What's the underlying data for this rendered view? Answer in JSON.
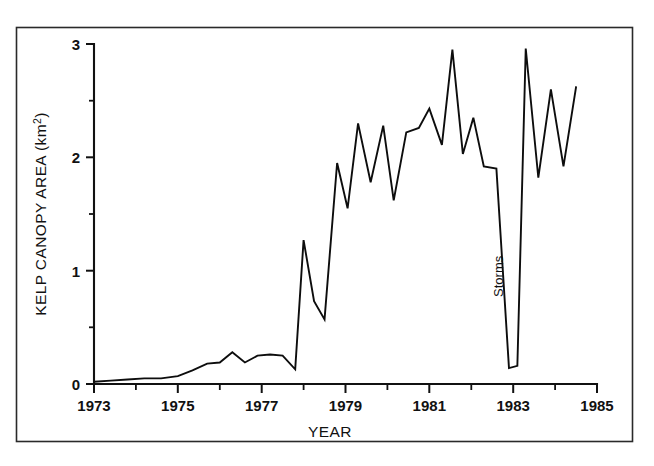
{
  "chart_data": {
    "type": "line",
    "title": "",
    "xlabel": "YEAR",
    "ylabel": "KELP CANOPY AREA (km",
    "ylabel_superscript": "2",
    "ylabel_suffix": ")",
    "ylabel_full": "KELP CANOPY AREA (km2)",
    "xlim": [
      1973,
      1985
    ],
    "ylim": [
      0,
      3
    ],
    "grid": false,
    "legend": null,
    "x_major_ticks": [
      1973,
      1975,
      1977,
      1979,
      1981,
      1983,
      1985
    ],
    "x_major_tick_labels": [
      "1973",
      "1975",
      "1977",
      "1979",
      "1981",
      "1983",
      "1985"
    ],
    "x_minor_ticks": [
      1974,
      1976,
      1978,
      1980,
      1982,
      1984
    ],
    "y_major_ticks": [
      0,
      1,
      2,
      3
    ],
    "y_major_tick_labels": [
      "0",
      "1",
      "2",
      "3"
    ],
    "y_minor_ticks": [
      0.5,
      1.5,
      2.5
    ],
    "annotations": [
      {
        "text": "Storms",
        "x": 1982.75,
        "y": 0.95,
        "rotation": -90
      }
    ],
    "series": [
      {
        "name": "Kelp canopy area",
        "x": [
          1973.0,
          1973.4,
          1973.8,
          1974.2,
          1974.6,
          1975.0,
          1975.35,
          1975.7,
          1976.0,
          1976.3,
          1976.6,
          1976.9,
          1977.2,
          1977.5,
          1977.8,
          1978.0,
          1978.25,
          1978.5,
          1978.8,
          1979.05,
          1979.3,
          1979.6,
          1979.9,
          1980.15,
          1980.45,
          1980.75,
          1981.0,
          1981.3,
          1981.55,
          1981.8,
          1982.05,
          1982.3,
          1982.6,
          1982.9,
          1983.1,
          1983.3,
          1983.6,
          1983.9,
          1984.2,
          1984.5
        ],
        "y": [
          0.02,
          0.03,
          0.04,
          0.05,
          0.05,
          0.07,
          0.12,
          0.18,
          0.19,
          0.28,
          0.19,
          0.25,
          0.26,
          0.25,
          0.13,
          1.27,
          0.73,
          0.57,
          1.95,
          1.55,
          2.3,
          1.78,
          2.28,
          1.62,
          2.22,
          2.26,
          2.43,
          2.11,
          2.95,
          2.03,
          2.35,
          1.92,
          1.9,
          0.14,
          0.16,
          2.96,
          1.82,
          2.6,
          1.92,
          2.62
        ]
      }
    ]
  },
  "figure": {
    "background_color": "#ffffff",
    "line_color": "#0d0d0d",
    "axis_color": "#111111",
    "frame_color": "#2a2a2a"
  }
}
